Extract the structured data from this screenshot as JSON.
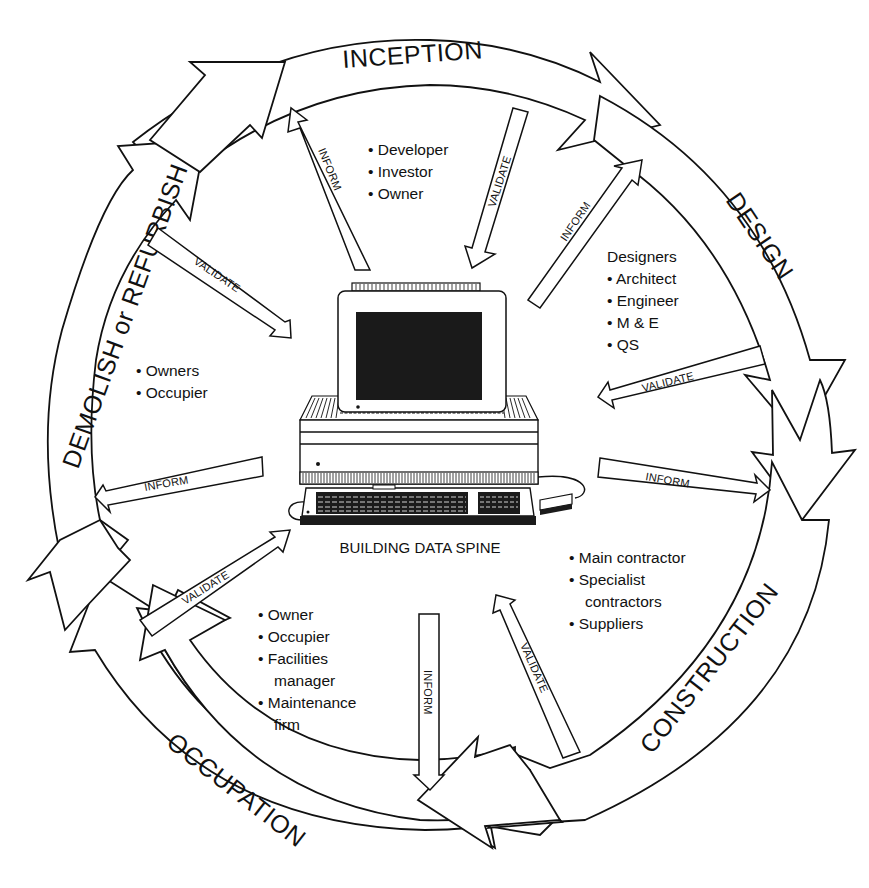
{
  "diagram": {
    "type": "cycle",
    "center": {
      "label": "BUILDING DATA SPINE",
      "icon": "computer-icon"
    },
    "stages": [
      {
        "id": "inception",
        "label": "INCEPTION"
      },
      {
        "id": "design",
        "label": "DESIGN"
      },
      {
        "id": "construction",
        "label": "CONSTRUCTION"
      },
      {
        "id": "occupation",
        "label": "OCCUPATION"
      },
      {
        "id": "demolish",
        "label": "DEMOLISH or REFURBISH"
      }
    ],
    "flows": {
      "inform": "INFORM",
      "validate": "VALIDATE"
    },
    "stakeholders": {
      "inception": {
        "items": [
          "Developer",
          "Investor",
          "Owner"
        ]
      },
      "design": {
        "heading": "Designers",
        "items": [
          "Architect",
          "Engineer",
          "M & E",
          "QS"
        ]
      },
      "construction": {
        "items": [
          "Main contractor",
          "Specialist",
          "contractors",
          "Suppliers"
        ]
      },
      "occupation": {
        "items": [
          "Owner",
          "Occupier",
          "Facilities",
          "manager",
          "Maintenance",
          "firm"
        ]
      },
      "demolish": {
        "items": [
          "Owners",
          "Occupier"
        ]
      }
    },
    "bullet": "•"
  }
}
